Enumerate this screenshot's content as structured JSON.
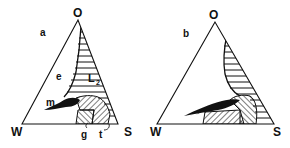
{
  "figure": {
    "type": "ternary phase diagram",
    "panels": [
      {
        "id": "a",
        "panel_label": "a",
        "vertices": {
          "top": "O",
          "left": "W",
          "right": "S"
        },
        "region_labels": {
          "e": "e",
          "L2": "L",
          "L2_sub": "2",
          "m": "m",
          "g": "g",
          "t": "t"
        }
      },
      {
        "id": "b",
        "panel_label": "b",
        "vertices": {
          "top": "O",
          "left": "W",
          "right": "S"
        }
      }
    ]
  },
  "colors": {
    "ink": "#111111",
    "background": "#ffffff"
  }
}
